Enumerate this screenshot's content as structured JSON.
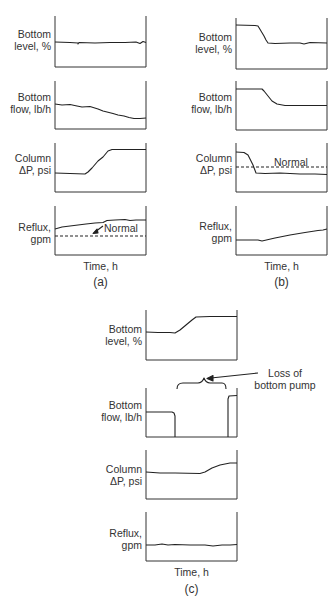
{
  "figure": {
    "panels": [
      {
        "caption": "(a)",
        "xlabel": "Time, h",
        "plots": [
          {
            "label_line1": "Bottom",
            "label_line2": "level, %"
          },
          {
            "label_line1": "Bottom",
            "label_line2": "flow, lb/h"
          },
          {
            "label_line1": "Column",
            "label_line2": "ΔP, psi"
          },
          {
            "label_line1": "Reflux,",
            "label_line2": "gpm",
            "reference_label": "Normal"
          }
        ]
      },
      {
        "caption": "(b)",
        "xlabel": "Time, h",
        "plots": [
          {
            "label_line1": "Bottom",
            "label_line2": "level, %"
          },
          {
            "label_line1": "Bottom",
            "label_line2": "flow, lb/h"
          },
          {
            "label_line1": "Column",
            "label_line2": "ΔP, psi",
            "reference_label": "Normal"
          },
          {
            "label_line1": "Reflux,",
            "label_line2": "gpm"
          }
        ]
      },
      {
        "caption": "(c)",
        "xlabel": "Time, h",
        "annotation_line1": "Loss of",
        "annotation_line2": "bottom pump",
        "plots": [
          {
            "label_line1": "Bottom",
            "label_line2": "level, %"
          },
          {
            "label_line1": "Bottom",
            "label_line2": "flow, lb/h"
          },
          {
            "label_line1": "Column",
            "label_line2": "ΔP, psi"
          },
          {
            "label_line1": "Reflux,",
            "label_line2": "gpm"
          }
        ]
      }
    ]
  }
}
